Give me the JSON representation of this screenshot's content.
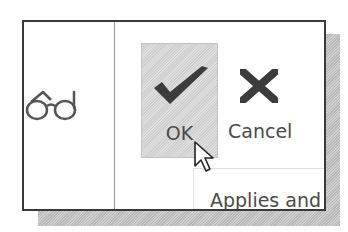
{
  "ribbon": {
    "left_icon": "glasses-icon",
    "ok_button": {
      "label": "OK",
      "icon": "checkmark-icon",
      "state": "hover"
    },
    "cancel_button": {
      "label": "Cancel",
      "icon": "x-icon"
    },
    "applies_text": "Applies and"
  },
  "colors": {
    "frame_border": "#3a3a3a",
    "ok_hover_bg": "#d6d6d6",
    "icon_dark": "#3c3c3c",
    "label_text": "#4a4a4a",
    "shadow": "#c4c4c4"
  },
  "cursor": "arrow-pointer"
}
